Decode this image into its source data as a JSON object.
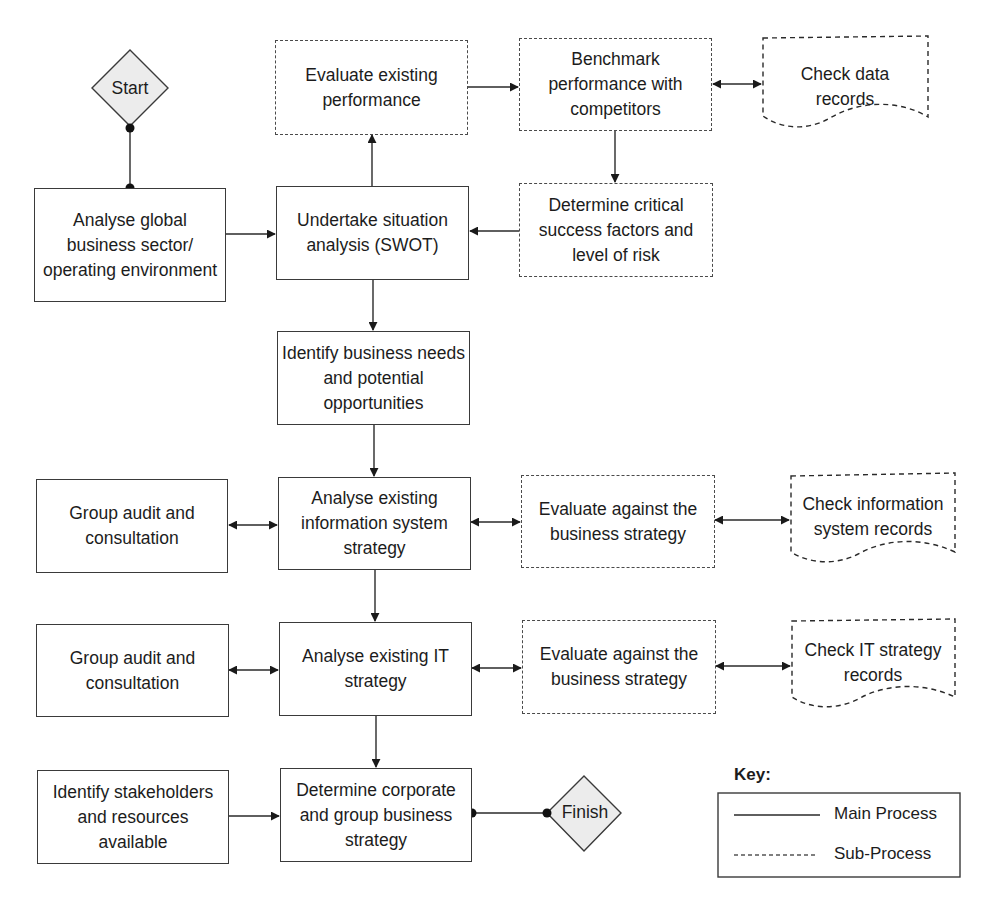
{
  "diagram": {
    "terminals": {
      "start": "Start",
      "finish": "Finish"
    },
    "main_process": {
      "analyse_global": "Analyse global business sector/ operating environment",
      "swot": "Undertake situation analysis (SWOT)",
      "identify_needs": "Identify business needs and potential opportunities",
      "analyse_is": "Analyse existing information system strategy",
      "analyse_it": "Analyse existing IT strategy",
      "determine_corporate": "Determine corporate and group business strategy",
      "group_audit_1": "Group audit and consultation",
      "group_audit_2": "Group audit and consultation",
      "identify_stakeholders": "Identify stakeholders and resources available"
    },
    "sub_process": {
      "evaluate_performance": "Evaluate existing performance",
      "benchmark": "Benchmark performance with competitors",
      "determine_csf": "Determine critical success factors and level of risk",
      "evaluate_is": "Evaluate against the business strategy",
      "evaluate_it": "Evaluate against the business strategy"
    },
    "documents": {
      "check_data": "Check data records",
      "check_is": "Check information system records",
      "check_it": "Check IT strategy records"
    },
    "key": {
      "title": "Key:",
      "main": "Main Process",
      "sub": "Sub-Process"
    },
    "colors": {
      "line": "#2a2a2a",
      "terminal_fill": "#ececec"
    }
  }
}
